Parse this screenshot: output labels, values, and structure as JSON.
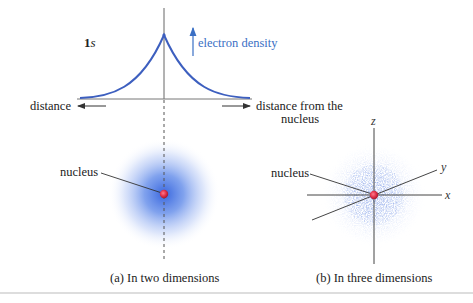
{
  "graph": {
    "orbital_label_num": "1",
    "orbital_label_letter": "s",
    "y_axis_label": "electron density",
    "x_left_label": "distance",
    "x_right_label_line1": "distance from the",
    "x_right_label_line2": "nucleus"
  },
  "panel_a": {
    "nucleus_label": "nucleus",
    "caption": "(a) In two dimensions"
  },
  "panel_b": {
    "nucleus_label": "nucleus",
    "axis_x": "x",
    "axis_y": "y",
    "axis_z": "z",
    "caption": "(b) In three dimensions"
  },
  "colors": {
    "curve": "#3d5fbf",
    "label_blue": "#3a6fc4",
    "axis": "#555555",
    "nucleus": "#e0304a",
    "cloud": "#3b6fe0",
    "divider": "#bbbbbb"
  }
}
